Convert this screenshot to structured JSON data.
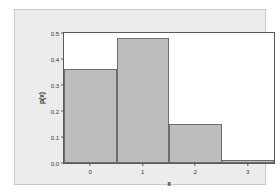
{
  "chart_data": {
    "type": "bar",
    "title": "",
    "xlabel": "x",
    "ylabel": "p(x)",
    "categories": [
      "0",
      "1",
      "2",
      "3"
    ],
    "x": [
      0,
      1,
      2,
      3
    ],
    "values": [
      0.36,
      0.48,
      0.15,
      0.01
    ],
    "series": [
      {
        "name": "p(x)",
        "values": [
          0.36,
          0.48,
          0.15,
          0.01
        ]
      }
    ],
    "ylim": [
      0.0,
      0.5
    ],
    "xlim": [
      -0.5,
      3.5
    ],
    "yticks": [
      "0.0",
      "0.1",
      "0.2",
      "0.3",
      "0.4",
      "0.5"
    ],
    "ytick_values": [
      0.0,
      0.1,
      0.2,
      0.3,
      0.4,
      0.5
    ],
    "xticks": [
      "0",
      "1",
      "2",
      "3"
    ],
    "xtick_values": [
      0,
      1,
      2,
      3
    ],
    "grid": false,
    "legend": null,
    "legend_position": "none",
    "bar_fill_color": "#bdbdbd",
    "bar_edge_color": "#6d6d6d",
    "plot_background_color": "#ffffff",
    "canvas_background_color": "#ececed",
    "axis_color": "#595959"
  }
}
